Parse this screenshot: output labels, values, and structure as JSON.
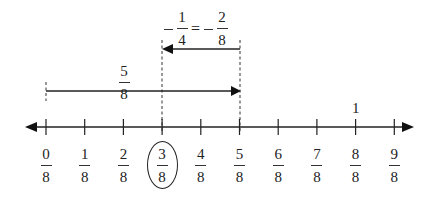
{
  "number_line": {
    "ticks": [
      {
        "num": "0",
        "den": "8",
        "value": 0
      },
      {
        "num": "1",
        "den": "8",
        "value": 1
      },
      {
        "num": "2",
        "den": "8",
        "value": 2
      },
      {
        "num": "3",
        "den": "8",
        "value": 3,
        "circled": true
      },
      {
        "num": "4",
        "den": "8",
        "value": 4
      },
      {
        "num": "5",
        "den": "8",
        "value": 5
      },
      {
        "num": "6",
        "den": "8",
        "value": 6
      },
      {
        "num": "7",
        "den": "8",
        "value": 7
      },
      {
        "num": "8",
        "den": "8",
        "value": 8
      },
      {
        "num": "9",
        "den": "8",
        "value": 9
      }
    ],
    "whole_label": {
      "text": "1",
      "at_value": 8
    }
  },
  "jumps": [
    {
      "id": "forward",
      "from": 0,
      "to": 5,
      "label": {
        "num": "5",
        "den": "8"
      }
    },
    {
      "id": "backward",
      "from": 5,
      "to": 3,
      "label": {
        "lhs_sign": "−",
        "lhs_num": "1",
        "lhs_den": "4",
        "equals": "=",
        "rhs_sign": "−",
        "rhs_num": "2",
        "rhs_den": "8"
      }
    }
  ],
  "answer": {
    "num": "3",
    "den": "8"
  }
}
